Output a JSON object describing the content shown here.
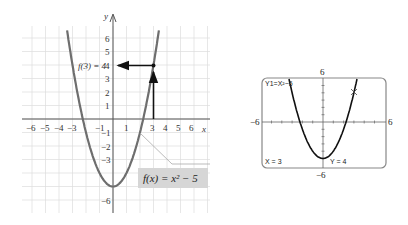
{
  "chart_data": [
    {
      "type": "line",
      "title": "",
      "function_label": "f(x) = x² − 5",
      "annotation": "f(3) = 4",
      "xlabel": "x",
      "ylabel": "y",
      "xlim": [
        -7,
        7
      ],
      "ylim": [
        -7,
        7
      ],
      "grid": true,
      "x_ticks": [
        "−6",
        "−5",
        "−4",
        "−3",
        "−1",
        "1",
        "3",
        "4",
        "5",
        "6"
      ],
      "y_ticks": [
        "6",
        "5",
        "4",
        "3",
        "2",
        "1",
        "−1",
        "−2",
        "−3",
        "−6"
      ],
      "series": [
        {
          "name": "f(x) = x^2 - 5",
          "x": [
            -3.5,
            -3,
            -2,
            -1,
            0,
            1,
            2,
            3,
            3.5
          ],
          "y": [
            7.25,
            4,
            -1,
            -4,
            -5,
            -4,
            -1,
            4,
            7.25
          ]
        }
      ],
      "highlight_point": {
        "x": 3,
        "y": 4
      },
      "arrows": [
        {
          "from": [
            3,
            0
          ],
          "to": [
            3,
            4
          ]
        },
        {
          "from": [
            3,
            4
          ],
          "to": [
            0,
            4
          ]
        }
      ]
    },
    {
      "type": "line",
      "title": "Graphing calculator screen",
      "equation_label": "Y1=X²−5",
      "window": {
        "xmin": -6,
        "xmax": 6,
        "ymin": -6,
        "ymax": 6
      },
      "window_labels": {
        "left": "−6",
        "right": "6",
        "top": "6",
        "bottom": "−6"
      },
      "trace": {
        "x_label": "X = 3",
        "y_label": "Y = 4",
        "x": 3,
        "y": 4
      },
      "series": [
        {
          "name": "Y1",
          "x": [
            -3.3,
            -3,
            -2,
            -1,
            0,
            1,
            2,
            3,
            3.3
          ],
          "y": [
            5.9,
            4,
            -1,
            -4,
            -5,
            -4,
            -1,
            4,
            5.9
          ]
        }
      ]
    }
  ],
  "left_graph": {
    "y_axis_label": "y",
    "x_axis_label": "x",
    "annotation": "f(3) = 4",
    "function_box": "f(x) = x² − 5",
    "colors": {
      "curve": "#6e6e6e",
      "grid": "#d9d9d9",
      "axis": "#555555",
      "arrow": "#111111",
      "label_box": "#d6d6d6",
      "annotation": "#aaaaaa"
    }
  },
  "calculator": {
    "equation": "Y1=X²−5",
    "x_readout": "X = 3",
    "y_readout": "Y = 4",
    "xmin_label": "−6",
    "xmax_label": "6",
    "ymax_label": "6",
    "ymin_label": "−6"
  }
}
